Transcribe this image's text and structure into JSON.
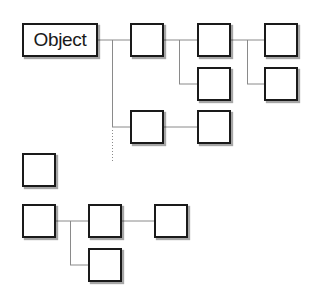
{
  "diagram": {
    "type": "object-hierarchy",
    "root": {
      "label": "Object"
    },
    "nodes": [
      {
        "id": "root",
        "label": "Object"
      },
      {
        "id": "a",
        "label": ""
      },
      {
        "id": "b",
        "label": ""
      },
      {
        "id": "c",
        "label": ""
      },
      {
        "id": "d",
        "label": ""
      },
      {
        "id": "e",
        "label": ""
      },
      {
        "id": "f",
        "label": ""
      },
      {
        "id": "g",
        "label": ""
      },
      {
        "id": "h",
        "label": ""
      },
      {
        "id": "i",
        "label": ""
      },
      {
        "id": "j",
        "label": ""
      },
      {
        "id": "k",
        "label": ""
      },
      {
        "id": "l",
        "label": ""
      }
    ],
    "edges": [
      {
        "from": "root",
        "to": "a",
        "style": "solid"
      },
      {
        "from": "root",
        "to": "f",
        "style": "solid"
      },
      {
        "from": "a",
        "to": "b",
        "style": "solid"
      },
      {
        "from": "a",
        "to": "c",
        "style": "solid"
      },
      {
        "from": "b",
        "to": "d",
        "style": "solid"
      },
      {
        "from": "b",
        "to": "e",
        "style": "solid"
      },
      {
        "from": "f",
        "to": "g",
        "style": "solid"
      },
      {
        "from": "root",
        "to": "more",
        "style": "dotted"
      },
      {
        "from": "i",
        "to": "j",
        "style": "solid"
      },
      {
        "from": "i",
        "to": "l",
        "style": "solid"
      },
      {
        "from": "j",
        "to": "k",
        "style": "solid"
      }
    ],
    "colors": {
      "stroke": "#1a1a1a",
      "connector": "#8a8a8a",
      "background": "#ffffff"
    }
  }
}
